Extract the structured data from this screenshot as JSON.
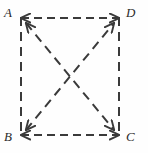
{
  "figure": {
    "kind": "geometry-diagram",
    "background_color": "#fefefe",
    "stroke_color": "#3a3a3a",
    "label_color": "#2b2b2b",
    "dash_pattern": "7 5",
    "stroke_width": 2,
    "vertices": [
      {
        "id": "A",
        "label": "A",
        "x": 21,
        "y": 18,
        "corner": "top-left"
      },
      {
        "id": "D",
        "label": "D",
        "x": 119,
        "y": 18,
        "corner": "top-right"
      },
      {
        "id": "B",
        "label": "B",
        "x": 21,
        "y": 135,
        "corner": "bottom-left"
      },
      {
        "id": "C",
        "label": "C",
        "x": 119,
        "y": 135,
        "corner": "bottom-right"
      }
    ],
    "edges": [
      {
        "id": "AD",
        "from": "A",
        "to": "D",
        "style": "dashed",
        "arrows": "both",
        "orientation": "horizontal"
      },
      {
        "id": "BC",
        "from": "B",
        "to": "C",
        "style": "dashed",
        "arrows": "both",
        "orientation": "horizontal"
      },
      {
        "id": "AB",
        "from": "A",
        "to": "B",
        "style": "dashed",
        "arrows": "none",
        "orientation": "vertical"
      },
      {
        "id": "DC",
        "from": "D",
        "to": "C",
        "style": "dashed",
        "arrows": "none",
        "orientation": "vertical"
      }
    ],
    "diagonals": [
      {
        "id": "AC",
        "from": "A",
        "to": "C",
        "style": "dashed",
        "arrows": "both"
      },
      {
        "id": "BD",
        "from": "B",
        "to": "D",
        "style": "dashed",
        "arrows": "both"
      }
    ],
    "intersection": {
      "id": "X",
      "x": 70,
      "y": 76.5,
      "marked": false
    }
  },
  "labels": {
    "a": "A",
    "b": "B",
    "c": "C",
    "d": "D"
  }
}
